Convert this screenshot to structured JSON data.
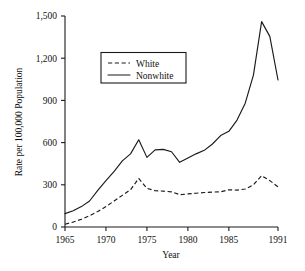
{
  "chart_data": {
    "type": "line",
    "title": "",
    "xlabel": "Year",
    "ylabel": "Rate per 100,000 Population",
    "xlim": [
      1965,
      1991
    ],
    "ylim": [
      0,
      1500
    ],
    "grid": false,
    "legend_position": "upper-left-inset",
    "x_ticks": [
      "1965",
      "1970",
      "1975",
      "1980",
      "1985",
      "1991"
    ],
    "x_tick_values": [
      1965,
      1970,
      1975,
      1980,
      1985,
      1991
    ],
    "y_ticks": [
      "0",
      "300",
      "600",
      "900",
      "1,200",
      "1,500"
    ],
    "y_tick_values": [
      0,
      300,
      600,
      900,
      1200,
      1500
    ],
    "x": [
      1965,
      1966,
      1967,
      1968,
      1969,
      1970,
      1971,
      1972,
      1973,
      1974,
      1975,
      1976,
      1977,
      1978,
      1979,
      1980,
      1981,
      1982,
      1983,
      1984,
      1985,
      1986,
      1987,
      1988,
      1989,
      1990,
      1991
    ],
    "series": [
      {
        "name": "White",
        "style": "dashed",
        "color": "#1a1a1a",
        "values": [
          20,
          35,
          55,
          80,
          110,
          145,
          185,
          225,
          265,
          345,
          275,
          258,
          255,
          250,
          230,
          235,
          240,
          245,
          248,
          250,
          265,
          262,
          270,
          300,
          365,
          330,
          285
        ]
      },
      {
        "name": "Nonwhite",
        "style": "solid",
        "color": "#1a1a1a",
        "values": [
          95,
          115,
          145,
          185,
          260,
          330,
          395,
          470,
          520,
          620,
          495,
          548,
          552,
          535,
          460,
          490,
          520,
          545,
          590,
          650,
          680,
          760,
          880,
          1080,
          1460,
          1355,
          1045
        ]
      }
    ]
  },
  "legend": {
    "entries": [
      {
        "label": "White",
        "style": "dashed"
      },
      {
        "label": "Nonwhite",
        "style": "solid"
      }
    ]
  },
  "axes": {
    "y_axis_title": "Rate per 100,000 Population",
    "x_axis_title": "Year"
  }
}
